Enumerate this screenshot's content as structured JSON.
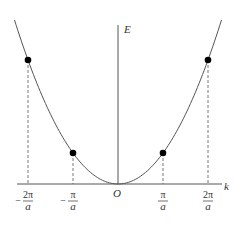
{
  "diagram": {
    "axes": {
      "x_label": "k",
      "y_label": "E",
      "origin_label": "O"
    },
    "curve": {
      "type": "parabola",
      "relation": "E ∝ k²",
      "k_range_a_units": [
        -2.3,
        2.3
      ]
    },
    "marked_points": [
      {
        "k_over_pi_a": -2,
        "label_sign": "−",
        "label_num": "2π",
        "label_den": "a"
      },
      {
        "k_over_pi_a": -1,
        "label_sign": "−",
        "label_num": "π",
        "label_den": "a"
      },
      {
        "k_over_pi_a": 1,
        "label_sign": "",
        "label_num": "π",
        "label_den": "a"
      },
      {
        "k_over_pi_a": 2,
        "label_sign": "",
        "label_num": "2π",
        "label_den": "a"
      }
    ],
    "colors": {
      "line": "#555555",
      "point": "#000000",
      "text": "#333333"
    }
  }
}
